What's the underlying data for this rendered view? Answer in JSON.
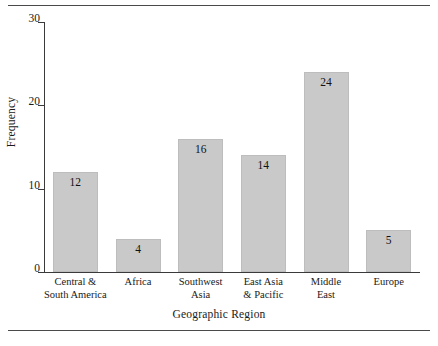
{
  "chart_data": {
    "type": "bar",
    "title": "",
    "xlabel": "Geographic Region",
    "ylabel": "Frequency",
    "categories": [
      "Central &\nSouth America",
      "Africa",
      "Southwest\nAsia",
      "East Asia\n& Pacific",
      "Middle\nEast",
      "Europe"
    ],
    "values": [
      12,
      4,
      16,
      14,
      24,
      5
    ],
    "value_labels": [
      "12",
      "4",
      "16",
      "14",
      "24",
      "5"
    ],
    "ylim": [
      0,
      30
    ],
    "yticks": [
      0,
      10,
      20,
      30
    ],
    "ytick_labels": [
      "0",
      "10",
      "20",
      "30"
    ],
    "grid": false,
    "legend": null,
    "bar_color": "#c9c9c9",
    "axis_color": "#3a3a3a"
  }
}
